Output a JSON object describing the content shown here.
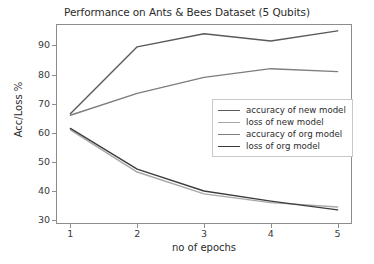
{
  "chart_data": {
    "type": "line",
    "title": "Performance on Ants & Bees Dataset (5 Qubits)",
    "xlabel": "no of epochs",
    "ylabel": "Acc/Loss %",
    "x": [
      1,
      2,
      3,
      4,
      5
    ],
    "xtick_labels": [
      "1",
      "2",
      "3",
      "4",
      "5"
    ],
    "ytick_labels": [
      "30",
      "40",
      "50",
      "60",
      "70",
      "80",
      "90"
    ],
    "xlim": [
      0.8,
      5.2
    ],
    "ylim": [
      29,
      97
    ],
    "grid": false,
    "legend_position": "center-right",
    "series": [
      {
        "name": "accuracy of new model",
        "values": [
          66.5,
          89.5,
          94.0,
          91.5,
          95.0
        ],
        "color": "#5a5a5a"
      },
      {
        "name": "loss of new model",
        "values": [
          61.0,
          46.5,
          39.0,
          36.0,
          34.5
        ],
        "color": "#a8a8a8"
      },
      {
        "name": "accuracy of org model",
        "values": [
          66.0,
          73.5,
          79.0,
          82.0,
          81.0
        ],
        "color": "#7d7d7d"
      },
      {
        "name": "loss of org model",
        "values": [
          61.5,
          47.5,
          40.0,
          36.5,
          33.5
        ],
        "color": "#3c3c3c"
      }
    ]
  },
  "legend": {
    "items": [
      {
        "label": "accuracy of new model"
      },
      {
        "label": "loss of new model"
      },
      {
        "label": "accuracy of org model"
      },
      {
        "label": "loss of org model"
      }
    ]
  }
}
